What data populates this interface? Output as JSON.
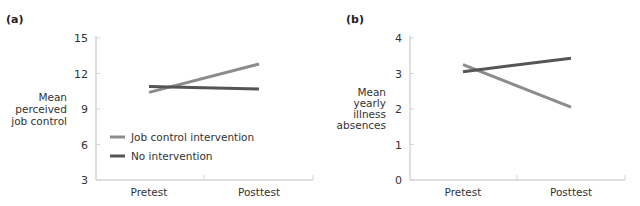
{
  "colors": {
    "job_control": "#8c8c8c",
    "no_intervention": "#555555",
    "axis": "#d4d4d4"
  },
  "legend": {
    "items": [
      {
        "label": "Job control intervention",
        "color": "#8c8c8c"
      },
      {
        "label": "No intervention",
        "color": "#555555"
      }
    ]
  },
  "chart_data": [
    {
      "panel": "(a)",
      "type": "line",
      "title": "(a)",
      "xlabel": "",
      "ylabel": "Mean perceived job control",
      "ylabel_lines": [
        "Mean",
        "perceived",
        "job control"
      ],
      "categories": [
        "Pretest",
        "Posttest"
      ],
      "ylim": [
        3,
        15
      ],
      "yticks": [
        3,
        6,
        9,
        12,
        15
      ],
      "grid": false,
      "legend_position": "lower left inside",
      "series": [
        {
          "name": "Job control intervention",
          "values": [
            10.4,
            12.8
          ]
        },
        {
          "name": "No intervention",
          "values": [
            10.9,
            10.7
          ]
        }
      ]
    },
    {
      "panel": "(b)",
      "type": "line",
      "title": "(b)",
      "xlabel": "",
      "ylabel": "Mean yearly illness absences",
      "ylabel_lines": [
        "Mean",
        "yearly",
        "illness",
        "absences"
      ],
      "categories": [
        "Pretest",
        "Posttest"
      ],
      "ylim": [
        0,
        4
      ],
      "yticks": [
        0,
        1,
        2,
        3,
        4
      ],
      "grid": false,
      "legend_position": "none",
      "series": [
        {
          "name": "Job control intervention",
          "values": [
            3.25,
            2.05
          ]
        },
        {
          "name": "No intervention",
          "values": [
            3.05,
            3.43
          ]
        }
      ]
    }
  ]
}
